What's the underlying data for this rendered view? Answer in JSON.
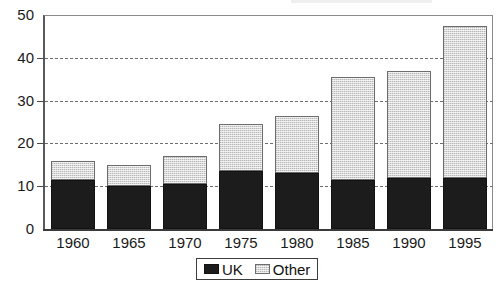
{
  "chart_data": {
    "type": "bar",
    "subtype": "stacked-vertical",
    "title": "",
    "xlabel": "",
    "ylabel": "",
    "ylim": [
      0,
      50
    ],
    "yticks": [
      0,
      10,
      20,
      30,
      40,
      50
    ],
    "grid": "horizontal-dashed",
    "legend_position": "bottom-center",
    "categories": [
      "1960",
      "1965",
      "1970",
      "1975",
      "1980",
      "1985",
      "1990",
      "1995"
    ],
    "series": [
      {
        "name": "UK",
        "color": "#1c1c1c",
        "values": [
          11.5,
          10,
          10.5,
          13.5,
          13,
          11.5,
          12,
          12
        ]
      },
      {
        "name": "Other",
        "color": "#d9d9d9",
        "values": [
          4.5,
          5,
          6.5,
          11,
          13.5,
          24,
          25,
          35.5
        ]
      }
    ],
    "totals": [
      16,
      15,
      17,
      24.5,
      26.5,
      35.5,
      37,
      47.5
    ]
  },
  "axis": {
    "y_tick_labels": [
      "50",
      "40",
      "30",
      "20",
      "10",
      "0"
    ]
  },
  "legend": {
    "entries": [
      {
        "label": "UK",
        "swatch": "black-solid-swatch"
      },
      {
        "label": "Other",
        "swatch": "light-gray-dotted-swatch"
      }
    ]
  }
}
